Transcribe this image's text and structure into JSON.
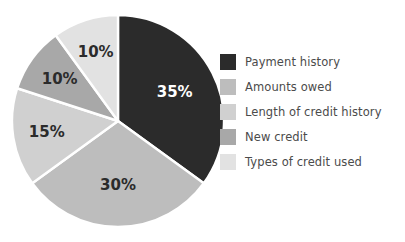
{
  "chart_data": {
    "type": "pie",
    "title": "",
    "categories": [
      "Payment history",
      "Amounts owed",
      "Length of credit history",
      "New credit",
      "Types of credit used"
    ],
    "values": [
      35,
      30,
      15,
      10,
      10
    ],
    "value_labels": [
      "35%",
      "30%",
      "15%",
      "10%",
      "10%"
    ],
    "colors": [
      "#2b2b2b",
      "#bdbdbd",
      "#d0d0d0",
      "#a8a8a8",
      "#e2e2e2"
    ],
    "label_text_colors": [
      "#ffffff",
      "#2b2b2b",
      "#2b2b2b",
      "#2b2b2b",
      "#2b2b2b"
    ],
    "start_angle_deg": 0,
    "direction": "clockwise",
    "slice_border_color": "#ffffff",
    "legend_position": "right",
    "grid": false
  },
  "legend": {
    "items": [
      {
        "label": "Payment history",
        "color": "#2b2b2b"
      },
      {
        "label": "Amounts owed",
        "color": "#bdbdbd"
      },
      {
        "label": "Length of credit history",
        "color": "#d0d0d0"
      },
      {
        "label": "New credit",
        "color": "#a8a8a8"
      },
      {
        "label": "Types of credit used",
        "color": "#e2e2e2"
      }
    ]
  }
}
